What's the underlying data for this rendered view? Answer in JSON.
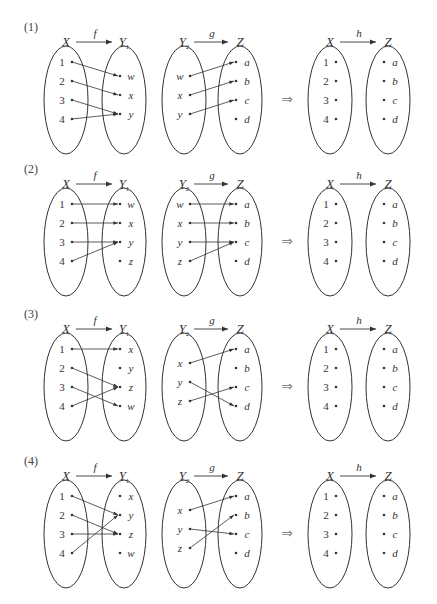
{
  "panels": [
    {
      "number": "(1)",
      "f": {
        "label": "f",
        "domain_label": "X",
        "codomain_label": "Y",
        "codomain_sub": "1",
        "domain": [
          "1",
          "2",
          "3",
          "4"
        ],
        "codomain": [
          "w",
          "x",
          "y"
        ],
        "mapping": [
          [
            "1",
            "w"
          ],
          [
            "2",
            "x"
          ],
          [
            "3",
            "y"
          ],
          [
            "4",
            "y"
          ]
        ]
      },
      "g": {
        "label": "g",
        "domain_label": "Y",
        "domain_sub": "2",
        "codomain_label": "Z",
        "domain": [
          "w",
          "x",
          "y"
        ],
        "codomain": [
          "a",
          "b",
          "c",
          "d"
        ],
        "mapping": [
          [
            "w",
            "a"
          ],
          [
            "x",
            "b"
          ],
          [
            "y",
            "c"
          ]
        ]
      },
      "h": {
        "label": "h",
        "domain_label": "X",
        "codomain_label": "Z",
        "domain": [
          "1",
          "2",
          "3",
          "4"
        ],
        "codomain": [
          "a",
          "b",
          "c",
          "d"
        ]
      }
    },
    {
      "number": "(2)",
      "f": {
        "label": "f",
        "domain_label": "X",
        "codomain_label": "Y",
        "codomain_sub": "1",
        "domain": [
          "1",
          "2",
          "3",
          "4"
        ],
        "codomain": [
          "w",
          "x",
          "y",
          "z"
        ],
        "mapping": [
          [
            "1",
            "w"
          ],
          [
            "2",
            "x"
          ],
          [
            "3",
            "y"
          ],
          [
            "4",
            "y"
          ]
        ]
      },
      "g": {
        "label": "g",
        "domain_label": "Y",
        "domain_sub": "2",
        "codomain_label": "Z",
        "domain": [
          "w",
          "x",
          "y",
          "z"
        ],
        "codomain": [
          "a",
          "b",
          "c",
          "d"
        ],
        "mapping": [
          [
            "w",
            "a"
          ],
          [
            "x",
            "b"
          ],
          [
            "y",
            "c"
          ],
          [
            "z",
            "c"
          ]
        ]
      },
      "h": {
        "label": "h",
        "domain_label": "X",
        "codomain_label": "Z",
        "domain": [
          "1",
          "2",
          "3",
          "4"
        ],
        "codomain": [
          "a",
          "b",
          "c",
          "d"
        ]
      }
    },
    {
      "number": "(3)",
      "f": {
        "label": "f",
        "domain_label": "X",
        "codomain_label": "Y",
        "codomain_sub": "1",
        "domain": [
          "1",
          "2",
          "3",
          "4"
        ],
        "codomain": [
          "x",
          "y",
          "z",
          "w"
        ],
        "mapping": [
          [
            "1",
            "x"
          ],
          [
            "2",
            "z"
          ],
          [
            "3",
            "w"
          ],
          [
            "4",
            "z"
          ]
        ]
      },
      "g": {
        "label": "g",
        "domain_label": "Y",
        "domain_sub": "2",
        "codomain_label": "Z",
        "domain": [
          "x",
          "y",
          "z"
        ],
        "codomain": [
          "a",
          "b",
          "c",
          "d"
        ],
        "mapping": [
          [
            "x",
            "a"
          ],
          [
            "y",
            "d"
          ],
          [
            "z",
            "c"
          ]
        ]
      },
      "h": {
        "label": "h",
        "domain_label": "X",
        "codomain_label": "Z",
        "domain": [
          "1",
          "2",
          "3",
          "4"
        ],
        "codomain": [
          "a",
          "b",
          "c",
          "d"
        ]
      }
    },
    {
      "number": "(4)",
      "f": {
        "label": "f",
        "domain_label": "X",
        "codomain_label": "Y",
        "codomain_sub": "1",
        "domain": [
          "1",
          "2",
          "3",
          "4"
        ],
        "codomain": [
          "x",
          "y",
          "z",
          "w"
        ],
        "mapping": [
          [
            "1",
            "y"
          ],
          [
            "2",
            "z"
          ],
          [
            "3",
            "z"
          ],
          [
            "4",
            "y"
          ]
        ]
      },
      "g": {
        "label": "g",
        "domain_label": "Y",
        "domain_sub": "2",
        "codomain_label": "Z",
        "domain": [
          "x",
          "y",
          "z"
        ],
        "codomain": [
          "a",
          "b",
          "c",
          "d"
        ],
        "mapping": [
          [
            "x",
            "a"
          ],
          [
            "y",
            "c"
          ],
          [
            "z",
            "b"
          ]
        ]
      },
      "h": {
        "label": "h",
        "domain_label": "X",
        "codomain_label": "Z",
        "domain": [
          "1",
          "2",
          "3",
          "4"
        ],
        "codomain": [
          "a",
          "b",
          "c",
          "d"
        ]
      }
    }
  ],
  "implies_arrow": "⇒",
  "colors": {
    "ink": "#333333",
    "arrow": "#888888"
  }
}
